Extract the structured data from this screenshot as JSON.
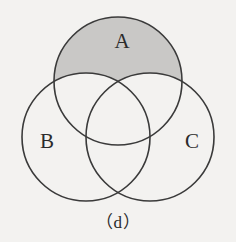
{
  "figure": {
    "caption": "（d）",
    "background_color": "#f3f2f0",
    "stroke_color": "#3a3a3a",
    "shade_color": "#c9c8c6",
    "label_color": "#2b2b2b"
  },
  "sets": [
    {
      "id": "A",
      "label": "A",
      "cx": 118,
      "cy": 81,
      "r": 64,
      "label_x": 122,
      "label_y": 43,
      "shaded": true
    },
    {
      "id": "B",
      "label": "B",
      "cx": 86,
      "cy": 137,
      "r": 64,
      "label_x": 47,
      "label_y": 143,
      "shaded": false
    },
    {
      "id": "C",
      "label": "C",
      "cx": 150,
      "cy": 137,
      "r": 64,
      "label_x": 192,
      "label_y": 143,
      "shaded": false
    }
  ],
  "chart_data": {
    "type": "diagram",
    "diagram_type": "venn",
    "title": "（d）",
    "set_count": 3,
    "set_names": [
      "A",
      "B",
      "C"
    ],
    "shaded_region_expression": "A \\ (B ∪ C)",
    "shaded_region_description": "The part of set A that lies outside both B and C",
    "shaded_regions": [
      "A only"
    ],
    "unshaded_regions": [
      "B only",
      "C only",
      "A ∩ B only",
      "A ∩ C only",
      "B ∩ C only",
      "A ∩ B ∩ C"
    ],
    "geometry": {
      "circle_radius": 64,
      "centers": {
        "A": [
          118,
          81
        ],
        "B": [
          86,
          137
        ],
        "C": [
          150,
          137
        ]
      },
      "units": "pixels"
    },
    "colors": {
      "shade": "#c9c8c6",
      "outline": "#3a3a3a",
      "background": "#f3f2f0"
    }
  }
}
